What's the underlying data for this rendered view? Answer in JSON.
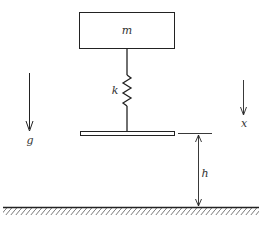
{
  "diagram": {
    "type": "mass-spring-drop-system",
    "labels": {
      "mass": "m",
      "spring": "k",
      "gravity": "g",
      "displacement": "x",
      "height": "h"
    },
    "components": {
      "mass_block": {
        "label": "m"
      },
      "spring": {
        "label": "k"
      },
      "plate": {},
      "ground": {
        "hatched": true
      }
    },
    "arrows": [
      {
        "name": "gravity",
        "label": "g",
        "direction": "down"
      },
      {
        "name": "displacement",
        "label": "x",
        "direction": "down"
      },
      {
        "name": "height",
        "label": "h",
        "direction": "both"
      }
    ],
    "colors": {
      "line": "#222222",
      "background": "#ffffff"
    }
  }
}
